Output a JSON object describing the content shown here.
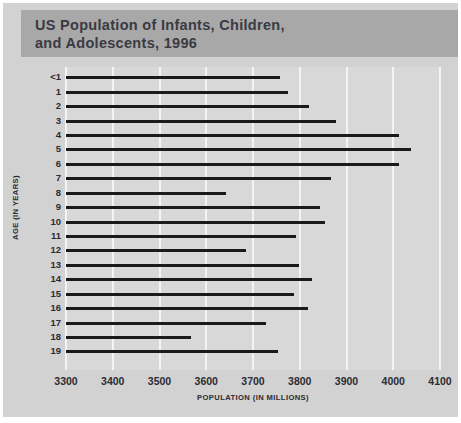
{
  "chart_data": {
    "type": "bar",
    "orientation": "horizontal",
    "title": "US Population of Infants, Children,\nand Adolescents, 1996",
    "xlabel": "POPULATION (IN MILLIONS)",
    "ylabel": "AGE (IN YEARS)",
    "categories": [
      "<1",
      "1",
      "2",
      "3",
      "4",
      "5",
      "6",
      "7",
      "8",
      "9",
      "10",
      "11",
      "12",
      "13",
      "14",
      "15",
      "16",
      "17",
      "18",
      "19"
    ],
    "values": [
      3757,
      3774,
      3819,
      3878,
      4013,
      4039,
      4013,
      3867,
      3642,
      3843,
      3853,
      3793,
      3686,
      3798,
      3827,
      3787,
      3818,
      3727,
      3568,
      3753
    ],
    "xlim": [
      3300,
      4100
    ],
    "xticks": [
      3300,
      3400,
      3500,
      3600,
      3700,
      3800,
      3900,
      4000,
      4100
    ],
    "xtick_labels": [
      "3300",
      "3400",
      "3500",
      "3600",
      "3700",
      "3800",
      "3900",
      "4000",
      "4100"
    ],
    "grid": "vertical",
    "legend": "none",
    "bar_color": "#1a1a1a",
    "plot_background": "#d8d8d8",
    "panel_background": "#d2d2d2",
    "banner_background": "#a8a8a8",
    "gridline_color": "#f4f4f4",
    "text_color": "#2b2b33"
  }
}
